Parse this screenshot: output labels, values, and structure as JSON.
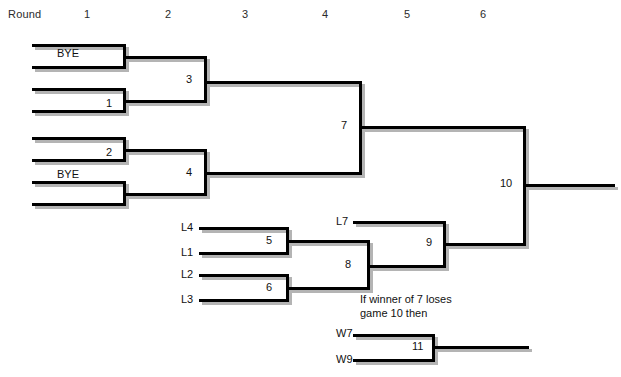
{
  "header": {
    "title_label": "Round",
    "rounds": [
      {
        "label": "1",
        "x": 84
      },
      {
        "label": "2",
        "x": 165
      },
      {
        "label": "3",
        "x": 242
      },
      {
        "label": "4",
        "x": 322
      },
      {
        "label": "5",
        "x": 404
      },
      {
        "label": "6",
        "x": 480
      }
    ]
  },
  "winners_bracket": {
    "entries": [
      {
        "label": "BYE",
        "x": 57,
        "y": 47
      },
      {
        "label": "",
        "x": 57,
        "y": 68
      },
      {
        "label": "",
        "x": 57,
        "y": 90
      },
      {
        "label": "",
        "x": 57,
        "y": 112
      },
      {
        "label": "",
        "x": 57,
        "y": 137
      },
      {
        "label": "",
        "x": 57,
        "y": 159
      },
      {
        "label": "BYE",
        "x": 57,
        "y": 168
      },
      {
        "label": "",
        "x": 57,
        "y": 202
      }
    ],
    "games": [
      {
        "number": "1",
        "x": 106,
        "y": 97
      },
      {
        "number": "2",
        "x": 106,
        "y": 146
      },
      {
        "number": "3",
        "x": 186,
        "y": 73
      },
      {
        "number": "4",
        "x": 186,
        "y": 166
      },
      {
        "number": "7",
        "x": 341,
        "y": 119
      },
      {
        "number": "10",
        "x": 500,
        "y": 177
      }
    ]
  },
  "losers_bracket": {
    "entries": [
      {
        "label": "L4",
        "x": 181,
        "y": 221
      },
      {
        "label": "L1",
        "x": 181,
        "y": 246
      },
      {
        "label": "L2",
        "x": 181,
        "y": 268
      },
      {
        "label": "L3",
        "x": 181,
        "y": 293
      },
      {
        "label": "L7",
        "x": 336,
        "y": 215
      }
    ],
    "games": [
      {
        "number": "5",
        "x": 266,
        "y": 234
      },
      {
        "number": "6",
        "x": 266,
        "y": 281
      },
      {
        "number": "8",
        "x": 345,
        "y": 258
      },
      {
        "number": "9",
        "x": 426,
        "y": 236
      }
    ]
  },
  "if_necessary": {
    "note": "If winner of 7 loses\ngame 10 then",
    "note_x": 360,
    "note_y": 292,
    "entries": [
      {
        "label": "W7",
        "x": 336,
        "y": 327
      },
      {
        "label": "W9",
        "x": 336,
        "y": 353
      }
    ],
    "games": [
      {
        "number": "11",
        "x": 412,
        "y": 340
      }
    ]
  },
  "colors": {
    "line": "#000000",
    "shadow": "#b4b4b4",
    "text": "#111111",
    "background": "#ffffff"
  }
}
